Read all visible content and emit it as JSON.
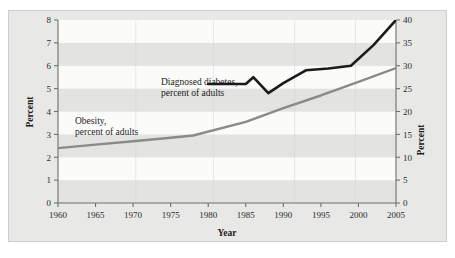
{
  "chart_data": {
    "type": "line",
    "title": "",
    "xlabel": "Year",
    "ylabel": "Percent",
    "ylabel_right": "Percent",
    "xlim": [
      1960,
      2005
    ],
    "ylim": [
      0,
      8
    ],
    "ylim_right": [
      0,
      40
    ],
    "grid": false,
    "background_bands": true,
    "legend": "annotations-on-plot",
    "xticks": [
      1960,
      1965,
      1970,
      1975,
      1980,
      1985,
      1990,
      1995,
      2000,
      2005
    ],
    "xtick_labels": [
      "1960",
      "1965",
      "1970",
      "1975",
      "1980",
      "1985",
      "1990",
      "1995",
      "2000",
      "2005"
    ],
    "yticks_left": [
      0,
      1,
      2,
      3,
      4,
      5,
      6,
      7,
      8
    ],
    "ytick_labels_left": [
      "0",
      "1",
      "2",
      "3",
      "4",
      "5",
      "6",
      "7",
      "8"
    ],
    "yticks_right": [
      0,
      5,
      10,
      15,
      20,
      25,
      30,
      35,
      40
    ],
    "ytick_labels_right": [
      "0",
      "5",
      "10",
      "15",
      "20",
      "25",
      "30",
      "35",
      "40"
    ],
    "series": [
      {
        "name": "Obesity, percent of adults",
        "axis": "left",
        "color": "#8a8a86",
        "width": 2.4,
        "x": [
          1960,
          1965,
          1970,
          1975,
          1978,
          1985,
          1990,
          1995,
          2000,
          2005
        ],
        "values": [
          2.4,
          2.55,
          2.7,
          2.85,
          2.95,
          3.55,
          4.15,
          4.7,
          5.3,
          5.9
        ]
      },
      {
        "name": "Diagnosed diabetes, percent of adults",
        "axis": "right",
        "color": "#1a1a1a",
        "width": 2.6,
        "x": [
          1980,
          1985,
          1986,
          1988,
          1990,
          1993,
          1996,
          1999,
          2002,
          2005
        ],
        "values": [
          26.0,
          26.0,
          27.5,
          24.0,
          26.2,
          29.0,
          29.4,
          30.0,
          34.5,
          40.0
        ]
      }
    ],
    "annotations": [
      {
        "name": "diabetes-annotation",
        "line1": "Diagnosed diabetes,",
        "line2": "percent of adults"
      },
      {
        "name": "obesity-annotation",
        "line1": "Obesity,",
        "line2": "percent of adults"
      }
    ],
    "colors": {
      "obesity_line": "#8a8a86",
      "diabetes_line": "#1a1a1a",
      "band_light": "#fbfbfa",
      "band_dark": "#e3e3e0",
      "figure_bg": "#e8e8e6",
      "axis": "#6f6f6b",
      "text": "#1c1c1c"
    }
  }
}
